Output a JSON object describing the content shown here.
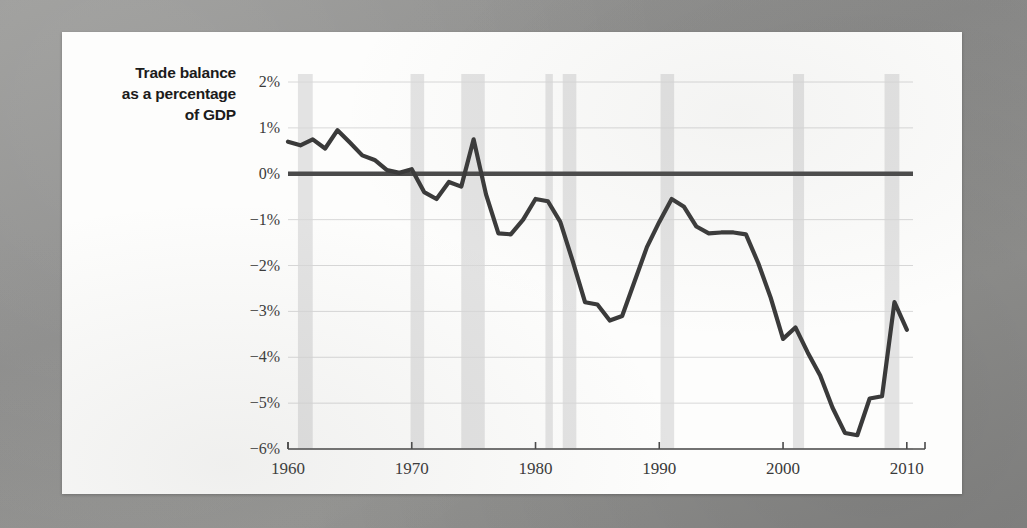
{
  "figure": {
    "axis_title_lines": [
      "Trade balance",
      "as a percentage",
      "of GDP"
    ]
  },
  "colors": {
    "line": "#3a3a3a",
    "zero_line": "#4a4a4a",
    "grid": "#d8d8d8",
    "recession_band": "#e3e3e3",
    "axis": "#4a4a4a",
    "paper": "#fdfdfc",
    "tick_text": "#3a3a3a"
  },
  "chart_data": {
    "type": "line",
    "title": "Trade balance as a percentage of GDP",
    "xlabel": "",
    "ylabel": "Trade balance as a percentage of GDP",
    "xlim": [
      1960,
      2010.5
    ],
    "ylim": [
      -6,
      2
    ],
    "grid": true,
    "legend": "none",
    "y_tick_labels": [
      "2%",
      "1%",
      "0%",
      "−1%",
      "−2%",
      "−3%",
      "−4%",
      "−5%",
      "−6%"
    ],
    "y_tick_values": [
      2,
      1,
      0,
      -1,
      -2,
      -3,
      -4,
      -5,
      -6
    ],
    "x_tick_labels": [
      "1960",
      "1970",
      "1980",
      "1990",
      "2000",
      "2010"
    ],
    "x_tick_values": [
      1960,
      1970,
      1980,
      1990,
      2000,
      2010
    ],
    "series": [
      {
        "name": "Trade balance (% of GDP)",
        "x": [
          1960,
          1961,
          1962,
          1963,
          1964,
          1965,
          1966,
          1967,
          1968,
          1969,
          1970,
          1971,
          1972,
          1973,
          1974,
          1975,
          1976,
          1977,
          1978,
          1979,
          1980,
          1981,
          1982,
          1983,
          1984,
          1985,
          1986,
          1987,
          1988,
          1989,
          1990,
          1991,
          1992,
          1993,
          1994,
          1995,
          1996,
          1997,
          1998,
          1999,
          2000,
          2001,
          2002,
          2003,
          2004,
          2005,
          2006,
          2007,
          2008,
          2009,
          2010
        ],
        "values": [
          0.7,
          0.62,
          0.75,
          0.55,
          0.95,
          0.68,
          0.4,
          0.3,
          0.08,
          0.02,
          0.1,
          -0.4,
          -0.55,
          -0.18,
          -0.28,
          0.75,
          -0.45,
          -1.3,
          -1.32,
          -1.0,
          -0.55,
          -0.6,
          -1.05,
          -1.9,
          -2.8,
          -2.85,
          -3.2,
          -3.1,
          -2.35,
          -1.6,
          -1.05,
          -0.55,
          -0.72,
          -1.15,
          -1.3,
          -1.28,
          -1.28,
          -1.32,
          -1.95,
          -2.7,
          -3.6,
          -3.35,
          -3.9,
          -4.4,
          -5.1,
          -5.65,
          -5.7,
          -4.9,
          -4.85,
          -2.8,
          -3.4
        ]
      }
    ],
    "recession_bands": [
      {
        "start": 1960.8,
        "end": 1962.0
      },
      {
        "start": 1969.9,
        "end": 1971.0
      },
      {
        "start": 1974.0,
        "end": 1975.9
      },
      {
        "start": 1980.8,
        "end": 1981.4
      },
      {
        "start": 1982.2,
        "end": 1983.3
      },
      {
        "start": 1990.1,
        "end": 1991.2
      },
      {
        "start": 2000.8,
        "end": 2001.7
      },
      {
        "start": 2008.2,
        "end": 2009.4
      }
    ],
    "zero_reference_line": 0
  }
}
